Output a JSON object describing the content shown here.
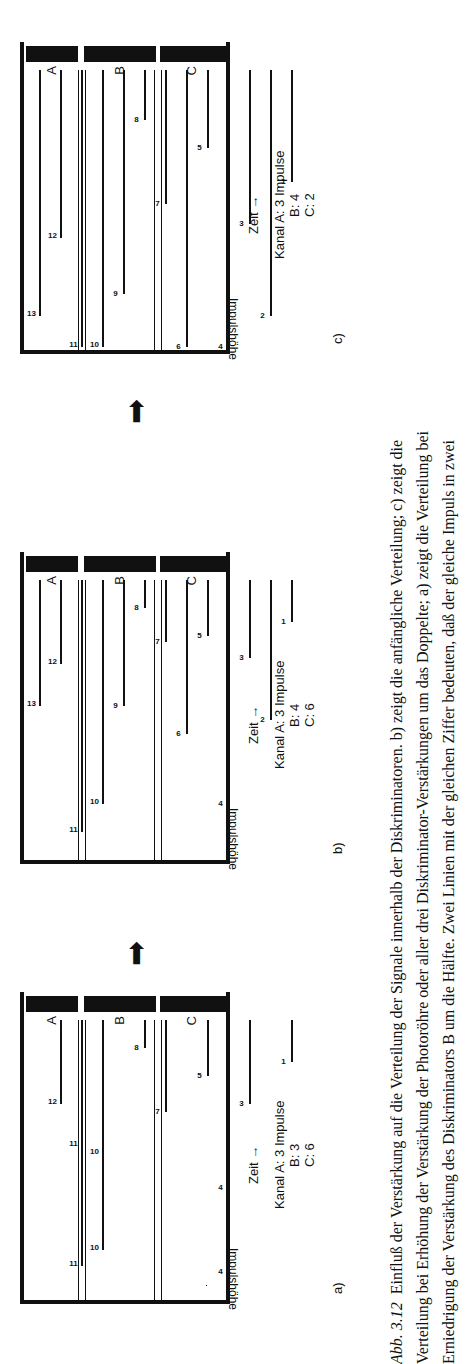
{
  "chart_data": [
    {
      "type": "bar",
      "panel": "a)",
      "title": "a)",
      "xlabel": "Zeit →",
      "ylabel": "Impulshöhe",
      "channels": [
        "A",
        "B",
        "C"
      ],
      "counts": {
        "A": 3,
        "B": 3,
        "C": 6
      },
      "pulses": [
        {
          "n": 1,
          "h": 0.15
        },
        {
          "n": 3,
          "h": 0.3
        },
        {
          "n": 4,
          "h": 0.6
        },
        {
          "n": 4,
          "h": 0.9
        },
        {
          "n": 5,
          "h": 0.2
        },
        {
          "n": 7,
          "h": 0.33
        },
        {
          "n": 8,
          "h": 0.1
        },
        {
          "n": 10,
          "h": 0.82
        },
        {
          "n": 10,
          "h": 0.48
        },
        {
          "n": 11,
          "h": 0.88
        },
        {
          "n": 11,
          "h": 0.45
        },
        {
          "n": 12,
          "h": 0.3
        }
      ]
    },
    {
      "type": "bar",
      "panel": "b)",
      "title": "b)",
      "xlabel": "Zeit →",
      "ylabel": "Impulshöhe",
      "channels": [
        "A",
        "B",
        "C"
      ],
      "counts": {
        "A": 3,
        "B": 4,
        "C": 6
      },
      "pulses": [
        {
          "n": 1,
          "h": 0.15
        },
        {
          "n": 2,
          "h": 0.5
        },
        {
          "n": 3,
          "h": 0.28
        },
        {
          "n": 4,
          "h": 0.8
        },
        {
          "n": 5,
          "h": 0.2
        },
        {
          "n": 6,
          "h": 0.55
        },
        {
          "n": 7,
          "h": 0.22
        },
        {
          "n": 8,
          "h": 0.1
        },
        {
          "n": 9,
          "h": 0.45
        },
        {
          "n": 10,
          "h": 0.8
        },
        {
          "n": 11,
          "h": 0.9
        },
        {
          "n": 12,
          "h": 0.3
        },
        {
          "n": 13,
          "h": 0.45
        }
      ]
    },
    {
      "type": "bar",
      "panel": "c)",
      "title": "c)",
      "xlabel": "Zeit →",
      "ylabel": "Impulshöhe",
      "channels": [
        "A",
        "B",
        "C"
      ],
      "counts": {
        "A": 3,
        "B": 4,
        "C": 2
      },
      "pulses": [
        {
          "n": 1,
          "h": 0.4
        },
        {
          "n": 2,
          "h": 0.88
        },
        {
          "n": 3,
          "h": 0.55
        },
        {
          "n": 4,
          "h": 0.99
        },
        {
          "n": 5,
          "h": 0.28
        },
        {
          "n": 6,
          "h": 0.99
        },
        {
          "n": 7,
          "h": 0.48
        },
        {
          "n": 8,
          "h": 0.18
        },
        {
          "n": 9,
          "h": 0.8
        },
        {
          "n": 10,
          "h": 0.99
        },
        {
          "n": 11,
          "h": 0.99
        },
        {
          "n": 12,
          "h": 0.6
        },
        {
          "n": 13,
          "h": 0.88
        }
      ]
    }
  ],
  "panels": [
    {
      "label": "a)",
      "zeit": "Zeit →",
      "kanal": "Kanal  A: 3 Impulse",
      "b": "B: 3",
      "c": "C: 6"
    },
    {
      "label": "b)",
      "zeit": "Zeit →",
      "kanal": "Kanal  A: 3 Impulse",
      "b": "B: 4",
      "c": "C: 6"
    },
    {
      "label": "c)",
      "zeit": "Zeit →",
      "kanal": "Kanal  A: 3 Impulse",
      "b": "B: 4",
      "c": "C: 2"
    }
  ],
  "ylabel": "Impulshöhe",
  "channels": {
    "a": "A",
    "b": "B",
    "c": "C"
  },
  "caption": {
    "fig": "Abb. 3.12",
    "line1": "Einfluß der Verstärkung auf die Verteilung der Signale innerhalb der Diskriminatoren. b) zeigt die anfängliche Verteilung; c) zeigt die",
    "line2": "Verteilung bei Erhöhung der Verstärkung der Photoröhre oder aller drei Diskriminator-Verstärkungen um das Doppelte; a) zeigt die Verteilung bei",
    "line3": "Erniedrigung der Verstärkung des Diskriminators B um die Hälfte. Zwei Linien mit der gleichen Ziffer bedeuten, daß der gleiche Impuls in zwei"
  }
}
